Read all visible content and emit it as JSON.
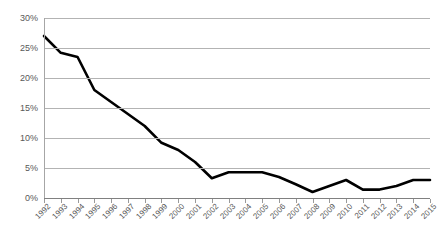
{
  "chart_data": {
    "type": "line",
    "title": "",
    "subtitle": "",
    "xlabel": "",
    "ylabel": "",
    "ylim": [
      0,
      30
    ],
    "ytick_labels": [
      "0%",
      "5%",
      "10%",
      "15%",
      "20%",
      "25%",
      "30%"
    ],
    "ytick_values": [
      0,
      5,
      10,
      15,
      20,
      25,
      30
    ],
    "grid": true,
    "legend": "none",
    "series_color": "#000000",
    "gridline_color": "#b3b3b3",
    "tick_label_color": "#595959",
    "categories": [
      "1992",
      "1993",
      "1994",
      "1995",
      "1996",
      "1997",
      "1998",
      "1999",
      "2000",
      "2001",
      "2002",
      "2003",
      "2004",
      "2005",
      "2006",
      "2007",
      "2008",
      "2009",
      "2010",
      "2011",
      "2012",
      "2013",
      "2014",
      "2015"
    ],
    "series": [
      {
        "name": "",
        "values": [
          27.0,
          24.2,
          23.5,
          18.0,
          16.0,
          14.0,
          12.0,
          9.2,
          8.0,
          6.0,
          3.3,
          4.3,
          4.3,
          4.3,
          3.5,
          2.3,
          1.0,
          2.0,
          3.0,
          1.4,
          1.4,
          2.0,
          3.0,
          3.0
        ]
      }
    ]
  }
}
